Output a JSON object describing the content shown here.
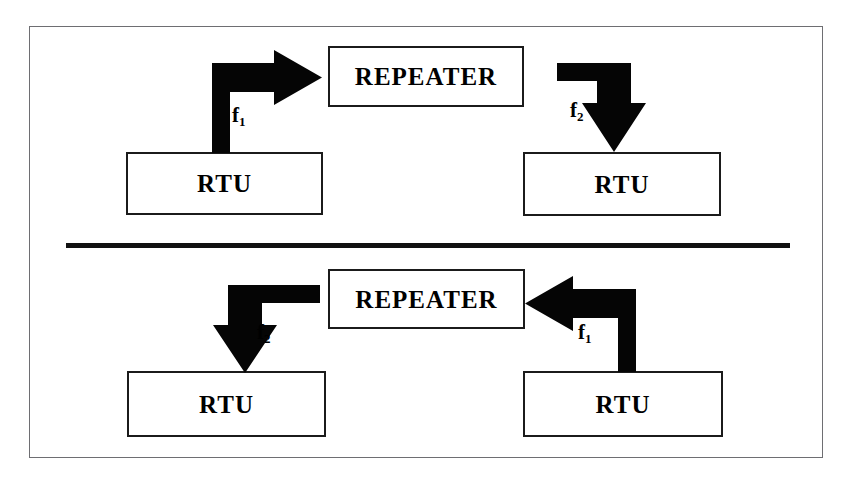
{
  "diagram": {
    "background_color": "#ffffff",
    "frame_color": "#6e6e72",
    "stroke_color": "#000000",
    "divider": {
      "label": "horizontal-divider",
      "color": "#111111"
    },
    "sections": [
      {
        "id": "uplink",
        "nodes": {
          "left_rtu": "RTU",
          "repeater": "REPEATER",
          "right_rtu": "RTU"
        },
        "flows": [
          {
            "id": "f1-top",
            "label": "f",
            "subscript": "1",
            "from": "left_rtu",
            "to": "repeater",
            "direction": "up-then-right"
          },
          {
            "id": "f2-top",
            "label": "f",
            "subscript": "2",
            "from": "repeater",
            "to": "right_rtu",
            "direction": "right-then-down"
          }
        ]
      },
      {
        "id": "downlink",
        "nodes": {
          "left_rtu": "RTU",
          "repeater": "REPEATER",
          "right_rtu": "RTU"
        },
        "flows": [
          {
            "id": "f2-bottom",
            "label": "f",
            "subscript": "2",
            "from": "repeater",
            "to": "left_rtu",
            "direction": "left-then-down"
          },
          {
            "id": "f1-bottom",
            "label": "f",
            "subscript": "1",
            "from": "right_rtu",
            "to": "repeater",
            "direction": "up-then-left"
          }
        ]
      }
    ]
  }
}
